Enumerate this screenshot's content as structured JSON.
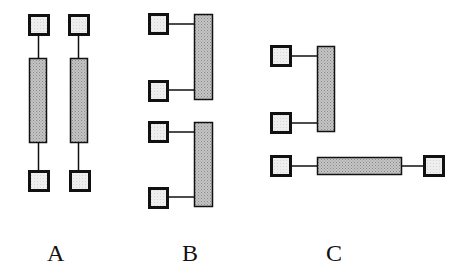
{
  "diagram": {
    "colors": {
      "stroke": "#111111",
      "square_fill": "#ececec",
      "bar_fill": "#b8b8b8",
      "background": "#ffffff"
    },
    "groups": [
      {
        "label": "A",
        "layout": "two vertical chains: square - bar - square",
        "elements": [
          {
            "type": "square",
            "x": 28,
            "y": 14,
            "w": 21,
            "h": 21
          },
          {
            "type": "bar",
            "x": 29,
            "y": 58,
            "w": 18,
            "h": 85
          },
          {
            "type": "square",
            "x": 28,
            "y": 170,
            "w": 21,
            "h": 21
          },
          {
            "type": "square",
            "x": 68,
            "y": 14,
            "w": 21,
            "h": 21
          },
          {
            "type": "bar",
            "x": 70,
            "y": 58,
            "w": 18,
            "h": 85
          },
          {
            "type": "square",
            "x": 69,
            "y": 170,
            "w": 21,
            "h": 21
          }
        ]
      },
      {
        "label": "B",
        "layout": "two stacked groups: two squares connected to the left side of a vertical bar",
        "elements": [
          {
            "type": "square",
            "x": 148,
            "y": 13,
            "w": 20,
            "h": 21
          },
          {
            "type": "square",
            "x": 148,
            "y": 80,
            "w": 20,
            "h": 21
          },
          {
            "type": "bar",
            "x": 194,
            "y": 14,
            "w": 19,
            "h": 86
          },
          {
            "type": "square",
            "x": 148,
            "y": 121,
            "w": 20,
            "h": 21
          },
          {
            "type": "square",
            "x": 148,
            "y": 187,
            "w": 20,
            "h": 21
          },
          {
            "type": "bar",
            "x": 194,
            "y": 122,
            "w": 19,
            "h": 85
          }
        ]
      },
      {
        "label": "C",
        "layout": "vertical bar with two squares on left; below, horizontal bar between two squares",
        "elements": [
          {
            "type": "square",
            "x": 270,
            "y": 45,
            "w": 21,
            "h": 21
          },
          {
            "type": "square",
            "x": 270,
            "y": 112,
            "w": 21,
            "h": 21
          },
          {
            "type": "bar",
            "x": 317,
            "y": 46,
            "w": 18,
            "h": 86
          },
          {
            "type": "square",
            "x": 270,
            "y": 155,
            "w": 21,
            "h": 21
          },
          {
            "type": "bar",
            "x": 317,
            "y": 157,
            "w": 85,
            "h": 18
          },
          {
            "type": "square",
            "x": 423,
            "y": 155,
            "w": 21,
            "h": 21
          }
        ]
      }
    ],
    "labels": {
      "a": "A",
      "b": "B",
      "c": "C"
    }
  }
}
